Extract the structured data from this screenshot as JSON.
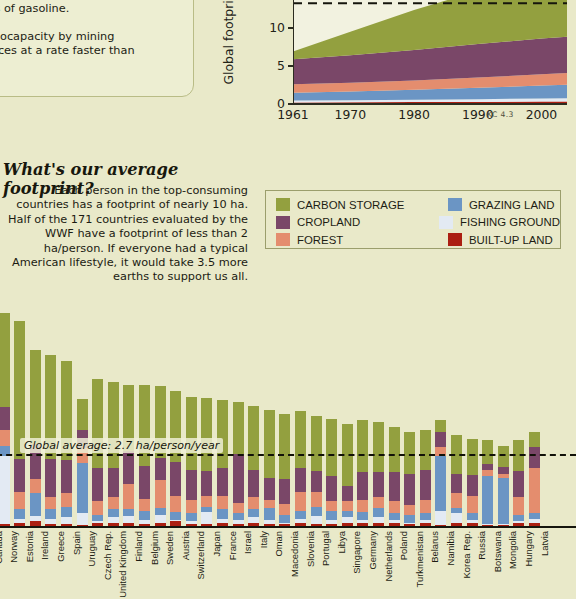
{
  "note_card": {
    "lines": [
      {
        "text": "a = 2.59 acres. One gha = 1 billion",
        "bold": true
      },
      {
        "text": "t an average hectare of land could",
        "bold": false
      },
      {
        "text": "450 liters of gasoline.",
        "bold": false
      },
      {
        "text": "",
        "bold": false
      },
      {
        "text": "earth's biocapacity by mining",
        "bold": false
      },
      {
        "text": "er resources at a rate faster than",
        "bold": false
      },
      {
        "text": "oduced.",
        "bold": false
      }
    ]
  },
  "area_chart": {
    "ylabel": "Global footprint (billion gha)",
    "annotation": "Earth's biocapacity: ~13 billion gha",
    "credit": "KC 4.3",
    "yticks": [
      "0",
      "5",
      "10",
      "15"
    ],
    "xticks": [
      "1961",
      "1970",
      "1980",
      "1990",
      "2000"
    ]
  },
  "legend": {
    "entries": [
      {
        "label": "CARBON STORAGE",
        "color": "#93a03f"
      },
      {
        "label": "GRAZING LAND",
        "color": "#6b95c4"
      },
      {
        "label": "CROPLAND",
        "color": "#7a4768"
      },
      {
        "label": "FISHING GROUND",
        "color": "#e3eaf3"
      },
      {
        "label": "FOREST",
        "color": "#e48d6e"
      },
      {
        "label": "BUILT-UP LAND",
        "color": "#ab1f12"
      }
    ]
  },
  "headline": "What's our average footprint?",
  "blurb": "Each person in the top-consuming countries has a footprint of nearly 10 ha. Half of the 171 countries evaluated by the WWF have a footprint of less than 2 ha/person. If everyone had a typical American lifestyle, it would take 3.5 more earths to support us all.",
  "bar_chart": {
    "average_label": "Global average: 2.7 ha/person/year",
    "average_value": 2.7
  },
  "chart_data": [
    {
      "type": "area",
      "title": "",
      "xlabel": "",
      "ylabel": "Global footprint (billion gha)",
      "xlim": [
        1961,
        2004
      ],
      "ylim": [
        0,
        18.5
      ],
      "grid": false,
      "legend_position": "external",
      "annotations": [
        {
          "text": "Earth's biocapacity: ~13 billion gha",
          "y": 13.3,
          "style": "dashed-line"
        }
      ],
      "x": [
        1961,
        1970,
        1980,
        1990,
        2000,
        2004
      ],
      "series": [
        {
          "name": "BUILT-UP LAND",
          "color": "#ab1f12",
          "values": [
            0.2,
            0.22,
            0.25,
            0.28,
            0.32,
            0.34
          ]
        },
        {
          "name": "FISHING GROUND",
          "color": "#e3eaf3",
          "values": [
            0.25,
            0.28,
            0.32,
            0.36,
            0.4,
            0.42
          ]
        },
        {
          "name": "GRAZING LAND",
          "color": "#6b95c4",
          "values": [
            1.05,
            1.15,
            1.3,
            1.5,
            1.72,
            1.8
          ]
        },
        {
          "name": "FOREST",
          "color": "#e48d6e",
          "values": [
            1.1,
            1.15,
            1.25,
            1.35,
            1.48,
            1.52
          ]
        },
        {
          "name": "CROPLAND",
          "color": "#7a4768",
          "values": [
            3.3,
            3.65,
            4.0,
            4.45,
            4.72,
            4.8
          ]
        },
        {
          "name": "CARBON STORAGE",
          "color": "#93a03f",
          "values": [
            1.05,
            3.1,
            5.3,
            7.0,
            8.4,
            9.6
          ]
        }
      ]
    },
    {
      "type": "bar",
      "stacked": true,
      "title": "",
      "xlabel": "",
      "ylabel": "hectares per person per year",
      "ylim": [
        0,
        10.5
      ],
      "grid": false,
      "annotations": [
        {
          "text": "Global average: 2.7 ha/person/year",
          "y": 2.7,
          "style": "dashed-line"
        }
      ],
      "series_names": [
        "BUILT-UP LAND",
        "FISHING GROUND",
        "GRAZING LAND",
        "FOREST",
        "CROPLAND",
        "CARBON STORAGE"
      ],
      "series_colors": [
        "#ab1f12",
        "#e3eaf3",
        "#6b95c4",
        "#e48d6e",
        "#7a4768",
        "#93a03f"
      ],
      "categories": [
        "Canada",
        "Norway",
        "Estonia",
        "Ireland",
        "Greece",
        "Spain",
        "Uruguay",
        "Czech Rep.",
        "United Kingdom",
        "Finland",
        "Belgium",
        "Sweden",
        "Austria",
        "Switzerland",
        "Japan",
        "France",
        "Israel",
        "Italy",
        "Oman",
        "Macedonia",
        "Slovenia",
        "Portugal",
        "Libya",
        "Singapore",
        "Germany",
        "Netherlands",
        "Poland",
        "Turkmenistan",
        "Belarus",
        "Namibia",
        "Korea Rep.",
        "Russia",
        "Botswana",
        "Mongolia",
        "Hungary",
        "Latvia"
      ],
      "values": [
        [
          0.2,
          0.25,
          0.6,
          0.8,
          1.3,
          5.95
        ],
        [
          0.15,
          2.55,
          0.4,
          0.6,
          0.85,
          3.55
        ],
        [
          0.2,
          0.15,
          0.35,
          0.65,
          1.25,
          5.2
        ],
        [
          0.25,
          0.2,
          0.85,
          0.55,
          1.3,
          3.55
        ],
        [
          0.15,
          0.2,
          0.35,
          0.45,
          1.45,
          3.9
        ],
        [
          0.15,
          0.25,
          0.4,
          0.5,
          1.25,
          3.75
        ],
        [
          0.1,
          0.45,
          1.9,
          0.55,
          0.7,
          1.15
        ],
        [
          0.2,
          0.05,
          0.25,
          0.5,
          1.25,
          3.35
        ],
        [
          0.2,
          0.2,
          0.3,
          0.45,
          1.1,
          3.25
        ],
        [
          0.2,
          0.25,
          0.25,
          0.95,
          1.25,
          2.5
        ],
        [
          0.15,
          0.15,
          0.35,
          0.45,
          1.25,
          3.05
        ],
        [
          0.2,
          0.3,
          0.25,
          1.05,
          0.85,
          2.7
        ],
        [
          0.25,
          0.05,
          0.3,
          0.6,
          1.3,
          2.65
        ],
        [
          0.15,
          0.1,
          0.3,
          0.5,
          1.15,
          2.75
        ],
        [
          0.15,
          0.45,
          0.2,
          0.4,
          0.95,
          2.75
        ],
        [
          0.2,
          0.15,
          0.35,
          0.5,
          1.05,
          2.55
        ],
        [
          0.15,
          0.15,
          0.25,
          0.4,
          1.85,
          1.95
        ],
        [
          0.2,
          0.2,
          0.3,
          0.45,
          1.05,
          2.4
        ],
        [
          0.15,
          0.15,
          0.45,
          0.3,
          0.85,
          2.55
        ],
        [
          0.15,
          0.05,
          0.3,
          0.4,
          0.95,
          2.45
        ],
        [
          0.2,
          0.15,
          0.3,
          0.7,
          0.9,
          2.15
        ],
        [
          0.15,
          0.3,
          0.35,
          0.55,
          0.8,
          2.05
        ],
        [
          0.15,
          0.15,
          0.35,
          0.35,
          0.95,
          2.15
        ],
        [
          0.2,
          0.2,
          0.25,
          0.35,
          0.6,
          2.3
        ],
        [
          0.2,
          0.1,
          0.3,
          0.45,
          1.05,
          1.95
        ],
        [
          0.2,
          0.2,
          0.35,
          0.4,
          0.95,
          1.9
        ],
        [
          0.2,
          0.1,
          0.25,
          0.45,
          1.1,
          1.7
        ],
        [
          0.15,
          0.05,
          0.3,
          0.35,
          1.2,
          1.55
        ],
        [
          0.2,
          0.1,
          0.25,
          0.5,
          1.15,
          1.5
        ],
        [
          0.1,
          0.55,
          2.05,
          0.35,
          0.55,
          0.45
        ],
        [
          0.2,
          0.35,
          0.2,
          0.55,
          0.75,
          1.45
        ],
        [
          0.2,
          0.1,
          0.25,
          0.65,
          0.8,
          1.35
        ],
        [
          0.1,
          0.05,
          1.8,
          0.25,
          0.2,
          0.9
        ],
        [
          0.1,
          0.05,
          1.75,
          0.15,
          0.25,
          0.8
        ],
        [
          0.2,
          0.05,
          0.25,
          0.65,
          1.0,
          1.15
        ],
        [
          0.2,
          0.15,
          0.2,
          1.7,
          0.8,
          0.55
        ]
      ]
    }
  ]
}
